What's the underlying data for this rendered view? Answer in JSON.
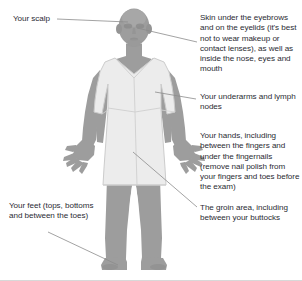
{
  "diagram": {
    "figure": {
      "name": "standing-person-in-hospital-gown",
      "skin_color": "#9a9a9a",
      "gown_color": "#ededed",
      "outline_color": "#c9c9c9",
      "background_color": "#ffffff"
    },
    "leader_line_color": "#8a8a8a",
    "text_color": "#2b2b33"
  },
  "callouts": [
    {
      "id": "scalp",
      "text": "Your scalp",
      "side": "left"
    },
    {
      "id": "eyebrows",
      "text": "Skin under the eyebrows and on the eyelids (it's best not to wear makeup or contact lenses), as well as inside the nose, eyes and mouth",
      "side": "right"
    },
    {
      "id": "underarms",
      "text": "Your underarms and lymph nodes",
      "side": "right"
    },
    {
      "id": "hands",
      "text": "Your hands, including between the fingers and under the fingernails (remove nail polish from your fingers and toes before the exam)",
      "side": "right"
    },
    {
      "id": "groin",
      "text": "The groin area, including between your buttocks",
      "side": "right"
    },
    {
      "id": "feet",
      "text": "Your feet (tops, bottoms and between the toes)",
      "side": "left"
    }
  ]
}
